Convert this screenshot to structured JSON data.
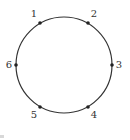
{
  "diagram": {
    "type": "circle-with-labeled-points",
    "circle": {
      "cx": 64,
      "cy": 65,
      "r": 48,
      "stroke": "#333333",
      "stroke_width": 1.2
    },
    "points": [
      {
        "label": "1",
        "x": 40,
        "y": 23,
        "lx": 34,
        "ly": 17
      },
      {
        "label": "2",
        "x": 88,
        "y": 23,
        "lx": 94,
        "ly": 17
      },
      {
        "label": "3",
        "x": 112,
        "y": 65,
        "lx": 119,
        "ly": 68
      },
      {
        "label": "4",
        "x": 88,
        "y": 107,
        "lx": 94,
        "ly": 118
      },
      {
        "label": "5",
        "x": 40,
        "y": 107,
        "lx": 34,
        "ly": 118
      },
      {
        "label": "6",
        "x": 16,
        "y": 65,
        "lx": 9,
        "ly": 68
      }
    ],
    "point_color": "#222222",
    "label_color": "#333333"
  }
}
